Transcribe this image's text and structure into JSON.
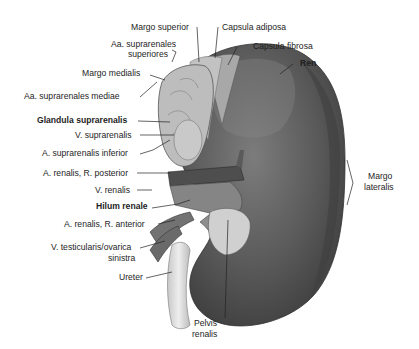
{
  "figure": {
    "colors": {
      "background": "#ffffff",
      "kidney_dark": "#4a4a4a",
      "kidney_mid": "#6e6e6e",
      "kidney_light": "#9a9a9a",
      "gland": "#b8b8b8",
      "vessel": "#7a7a7a",
      "ureter": "#d8d8d8",
      "leader_line": "#222222"
    }
  },
  "labels": {
    "margo_superior": "Margo superior",
    "capsula_adiposa": "Capsula adiposa",
    "aa_suprarenales_superiores_1": "Aa. suprarenales",
    "aa_suprarenales_superiores_2": "superiores",
    "capsula_fibrosa": "Capsula fibrosa",
    "margo_medialis": "Margo medialis",
    "ren": "Ren",
    "aa_suprarenales_mediae": "Aa. suprarenales mediae",
    "glandula_suprarenalis": "Glandula suprarenalis",
    "v_suprarenalis": "V. suprarenalis",
    "a_suprarenalis_inferior": "A. suprarenalis inferior",
    "a_renalis_r_posterior": "A. renalis, R. posterior",
    "v_renalis": "V. renalis",
    "hilum_renale": "Hilum renale",
    "a_renalis_r_anterior": "A. renalis, R. anterior",
    "v_testicularis_1": "V. testicularis/ovarica",
    "v_testicularis_2": "sinistra",
    "ureter": "Ureter",
    "margo_lateralis_1": "Margo",
    "margo_lateralis_2": "lateralis",
    "pelvis_renalis_1": "Pelvis",
    "pelvis_renalis_2": "renalis"
  }
}
